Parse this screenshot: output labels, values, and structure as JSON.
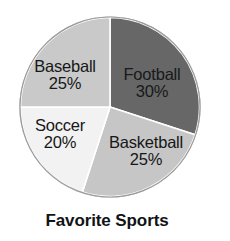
{
  "chart_data": {
    "type": "pie",
    "title": "Favorite Sports",
    "xlabel": "",
    "ylabel": "",
    "legend_position": "none",
    "grid": false,
    "labels_inside_slices": true,
    "start_angle_deg": 0,
    "direction": "clockwise",
    "categories": [
      "Football",
      "Basketball",
      "Soccer",
      "Baseball"
    ],
    "values": [
      30,
      25,
      20,
      25
    ],
    "value_unit": "%",
    "slices": [
      {
        "name": "Football",
        "value": 30,
        "percent_text": "30%",
        "color": "#676767",
        "text_color": "#17191a",
        "start_deg": 0,
        "end_deg": 108
      },
      {
        "name": "Basketball",
        "value": 25,
        "percent_text": "25%",
        "color": "#c6c6c6",
        "text_color": "#161718",
        "start_deg": 108,
        "end_deg": 198
      },
      {
        "name": "Soccer",
        "value": 20,
        "percent_text": "20%",
        "color": "#f2f2f2",
        "text_color": "#161718",
        "start_deg": 198,
        "end_deg": 270
      },
      {
        "name": "Baseball",
        "value": 25,
        "percent_text": "25%",
        "color": "#c9c9c9",
        "text_color": "#161718",
        "start_deg": 270,
        "end_deg": 360
      }
    ],
    "outline_color": "#9a9a9a",
    "separator_color": "#ffffff"
  },
  "chart": {
    "title": "Favorite Sports",
    "football": {
      "name": "Football",
      "percent": "30%"
    },
    "basketball": {
      "name": "Basketball",
      "percent": "25%"
    },
    "soccer": {
      "name": "Soccer",
      "percent": "20%"
    },
    "baseball": {
      "name": "Baseball",
      "percent": "25%"
    }
  },
  "page": {
    "border_color": "#b9b9b9",
    "background": "#ffffff"
  }
}
